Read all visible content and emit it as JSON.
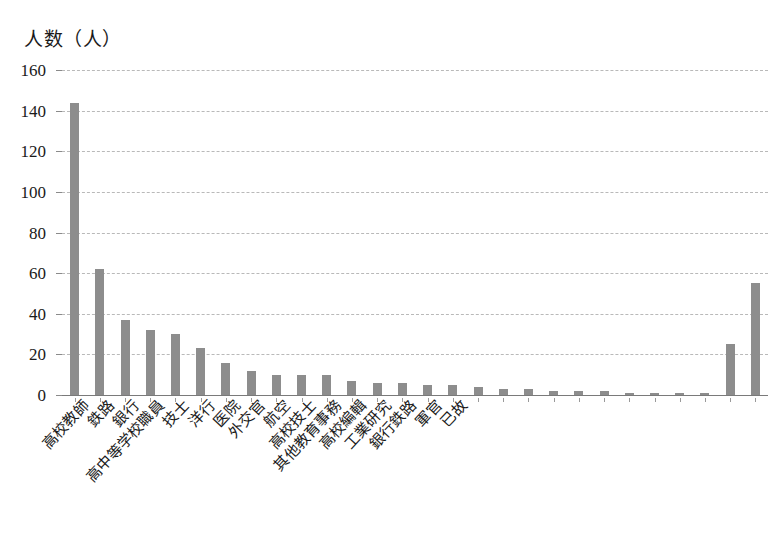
{
  "chart_data": {
    "type": "bar",
    "title": "人数（人）",
    "xlabel": "",
    "ylabel": "人数（人）",
    "ylim": [
      0,
      160
    ],
    "ytick_values": [
      0,
      20,
      40,
      60,
      80,
      100,
      120,
      140,
      160
    ],
    "ytick_labels": [
      "0",
      "20",
      "40",
      "60",
      "80",
      "100",
      "120",
      "140",
      "160"
    ],
    "grid": true,
    "legend": "none",
    "bar_color": "#8d8d8d",
    "categories": [
      "高校教師",
      "鉄路",
      "銀行",
      "高中等学校職員",
      "技士",
      "洋行",
      "医院",
      "外交官",
      "航空",
      "高校技士",
      "其他教育事務",
      "高校編輯",
      "工業研究",
      "銀行鉄路",
      "軍官",
      "已故",
      "",
      "",
      "",
      "",
      "",
      "",
      "",
      "",
      "",
      "",
      "",
      ""
    ],
    "labeled_categories": [
      "高校教師",
      "鉄路",
      "銀行",
      "高中等学校職員",
      "技士",
      "洋行",
      "医院",
      "外交官",
      "航空",
      "高校技士",
      "其他教育事務",
      "高校編輯",
      "工業研究",
      "銀行鉄路",
      "軍官",
      "已故"
    ],
    "values": [
      144,
      62,
      37,
      32,
      30,
      23,
      16,
      12,
      10,
      10,
      10,
      7,
      6,
      6,
      5,
      5,
      4,
      3,
      3,
      2,
      2,
      2,
      1,
      1,
      1,
      1,
      25,
      55
    ]
  }
}
